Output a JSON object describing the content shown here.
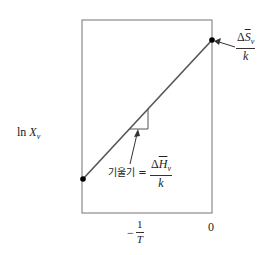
{
  "diagram": {
    "y_axis_label": {
      "prefix": "ln ",
      "var": "X",
      "sub": "v"
    },
    "x_ticks": [
      {
        "label_num": "1",
        "label_den": "T",
        "sign": "−"
      },
      {
        "label": "0"
      }
    ],
    "intercept_label": {
      "num_delta": "Δ",
      "num_var": "S",
      "num_sub": "v",
      "den": "k"
    },
    "slope_label": {
      "text": "기울기 =",
      "num_delta": "Δ",
      "num_var": "H",
      "num_sub": "v",
      "den": "k"
    },
    "colors": {
      "frame": "#8a8a8a",
      "line": "#555555",
      "point": "#000000"
    }
  }
}
